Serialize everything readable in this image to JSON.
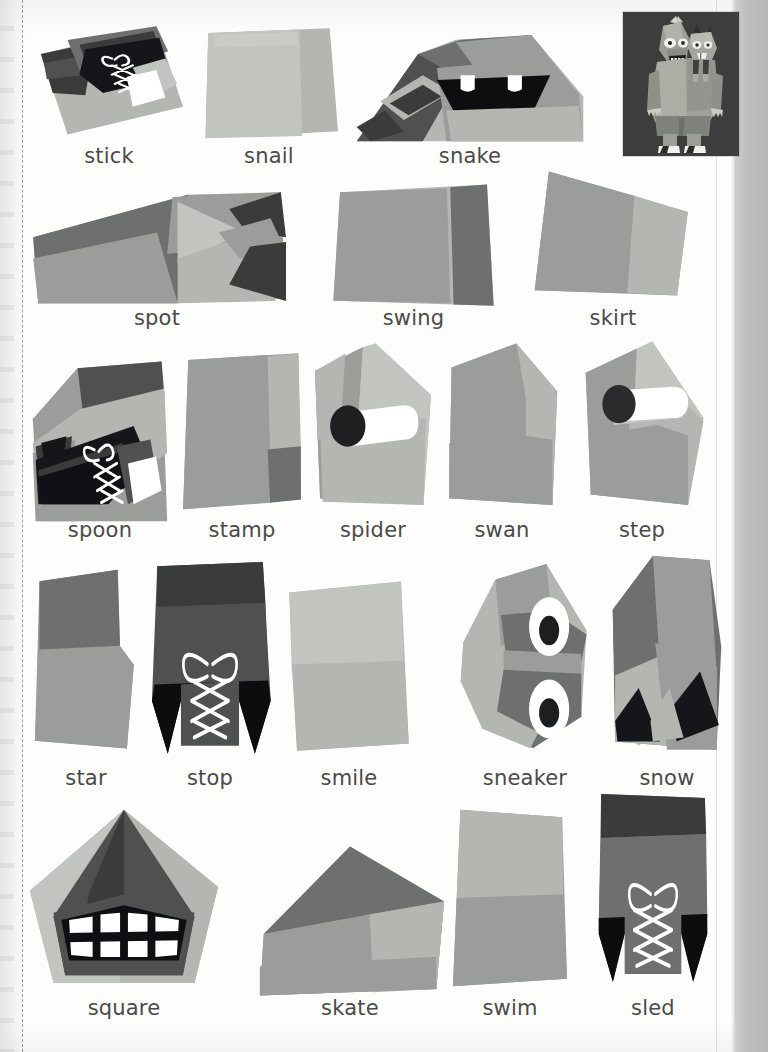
{
  "page": {
    "type": "worksheet-page",
    "background_color": "#fdfdfc",
    "text_color": "#4a4a4a",
    "right_band_color": "#bdbfbd",
    "dashed_guide_color": "#8d8f8d"
  },
  "portrait": {
    "name": "two-headed-monster-illustration",
    "background_color": "#3d3d3d",
    "body_color": "#8d8f88",
    "accent_color": "#a9aba3",
    "shoe_color": "#ffffff"
  },
  "cards": [
    {
      "id": "stick",
      "label": "stick",
      "art": "stick",
      "x": 35,
      "y": 24,
      "w": 148,
      "h": 115,
      "lx": 35,
      "lw": 148,
      "ly": 144
    },
    {
      "id": "snail",
      "label": "snail",
      "art": "snail",
      "x": 200,
      "y": 26,
      "w": 138,
      "h": 117,
      "lx": 200,
      "lw": 138,
      "ly": 144
    },
    {
      "id": "snake",
      "label": "snake",
      "art": "snake",
      "x": 352,
      "y": 28,
      "w": 236,
      "h": 118,
      "lx": 352,
      "lw": 236,
      "ly": 144
    },
    {
      "id": "spot",
      "label": "spot",
      "art": "spot",
      "x": 28,
      "y": 190,
      "w": 258,
      "h": 118,
      "lx": 28,
      "lw": 258,
      "ly": 306
    },
    {
      "id": "swing",
      "label": "swing",
      "art": "swing",
      "x": 330,
      "y": 182,
      "w": 167,
      "h": 129,
      "lx": 330,
      "lw": 167,
      "ly": 306
    },
    {
      "id": "skirt",
      "label": "skirt",
      "art": "skirt",
      "x": 524,
      "y": 166,
      "w": 178,
      "h": 135,
      "lx": 524,
      "lw": 178,
      "ly": 306
    },
    {
      "id": "spoon",
      "label": "spoon",
      "art": "spoon",
      "x": 30,
      "y": 358,
      "w": 140,
      "h": 170,
      "lx": 26,
      "lw": 148,
      "ly": 518
    },
    {
      "id": "stamp",
      "label": "stamp",
      "art": "stamp",
      "x": 178,
      "y": 350,
      "w": 128,
      "h": 166,
      "lx": 178,
      "lw": 128,
      "ly": 518
    },
    {
      "id": "spider",
      "label": "spider",
      "art": "spider",
      "x": 310,
      "y": 340,
      "w": 126,
      "h": 172,
      "lx": 310,
      "lw": 126,
      "ly": 518
    },
    {
      "id": "swan",
      "label": "swan",
      "art": "swan",
      "x": 442,
      "y": 340,
      "w": 120,
      "h": 172,
      "lx": 442,
      "lw": 120,
      "ly": 518
    },
    {
      "id": "step",
      "label": "step",
      "art": "step",
      "x": 578,
      "y": 338,
      "w": 128,
      "h": 174,
      "lx": 578,
      "lw": 128,
      "ly": 518
    },
    {
      "id": "star",
      "label": "star",
      "art": "star",
      "x": 28,
      "y": 566,
      "w": 115,
      "h": 190,
      "lx": 24,
      "lw": 124,
      "ly": 766
    },
    {
      "id": "stop",
      "label": "stop",
      "art": "stop",
      "x": 144,
      "y": 558,
      "w": 132,
      "h": 204,
      "lx": 148,
      "lw": 124,
      "ly": 766
    },
    {
      "id": "smile",
      "label": "smile",
      "art": "smile",
      "x": 284,
      "y": 578,
      "w": 130,
      "h": 180,
      "lx": 284,
      "lw": 130,
      "ly": 766
    },
    {
      "id": "sneaker",
      "label": "sneaker",
      "art": "sneaker",
      "x": 458,
      "y": 560,
      "w": 134,
      "h": 196,
      "lx": 452,
      "lw": 146,
      "ly": 766
    },
    {
      "id": "snow",
      "label": "snow",
      "art": "snow",
      "x": 608,
      "y": 552,
      "w": 118,
      "h": 206,
      "lx": 604,
      "lw": 126,
      "ly": 766
    },
    {
      "id": "square",
      "label": "square",
      "art": "square",
      "x": 26,
      "y": 806,
      "w": 196,
      "h": 184,
      "lx": 26,
      "lw": 196,
      "ly": 996
    },
    {
      "id": "skate",
      "label": "skate",
      "art": "skate",
      "x": 252,
      "y": 840,
      "w": 196,
      "h": 162,
      "lx": 252,
      "lw": 196,
      "ly": 996
    },
    {
      "id": "swim",
      "label": "swim",
      "art": "swim",
      "x": 448,
      "y": 802,
      "w": 124,
      "h": 192,
      "lx": 448,
      "lw": 124,
      "ly": 996
    },
    {
      "id": "sled",
      "label": "sled",
      "art": "sled",
      "x": 594,
      "y": 790,
      "w": 118,
      "h": 200,
      "lx": 594,
      "lw": 118,
      "ly": 996
    }
  ],
  "palette": {
    "mid_gray": "#9b9d9a",
    "light_gray": "#b4b6b2",
    "pale_gray": "#c2c4c0",
    "dark_gray": "#6e7070",
    "darker_gray": "#4f5050",
    "charcoal": "#3a3b3b",
    "black": "#111111",
    "white": "#ffffff"
  }
}
